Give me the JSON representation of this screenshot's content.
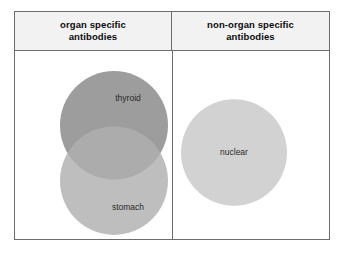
{
  "figure": {
    "type": "venn-diagram",
    "columns": [
      {
        "id": "organ-specific",
        "header": "organ specific\nantibodies"
      },
      {
        "id": "non-organ-specific",
        "header": "non-organ specific\nantibodies"
      }
    ],
    "header_left_line1": "organ specific",
    "header_left_line2": "antibodies",
    "header_right_line1": "non-organ specific",
    "header_right_line2": "antibodies",
    "sets": [
      {
        "id": "thyroid",
        "label": "thyroid",
        "column": "organ-specific",
        "cx": 99,
        "cy": 74,
        "r": 54,
        "fill": "#9d9d9d",
        "label_x": 113,
        "label_y": 47
      },
      {
        "id": "stomach",
        "label": "stomach",
        "column": "organ-specific",
        "cx": 99,
        "cy": 129,
        "r": 54,
        "fill": "#b0b0b0",
        "label_x": 113,
        "label_y": 156
      },
      {
        "id": "nuclear",
        "label": "nuclear",
        "column": "non-organ-specific",
        "cx": 219,
        "cy": 101,
        "r": 53,
        "fill": "#d2d2d2",
        "label_x": 219,
        "label_y": 101
      }
    ],
    "colors": {
      "frame_border": "#6d6d6d",
      "header_background": "#f2f2f2",
      "page_background": "#ffffff",
      "thyroid_fill": "#9d9d9d",
      "stomach_fill": "#b0b0b0",
      "nuclear_fill": "#d2d2d2",
      "overlap_thyroid_stomach": "#878787",
      "label_text": "#2a2a2a",
      "header_text": "#0c0c0c"
    }
  }
}
